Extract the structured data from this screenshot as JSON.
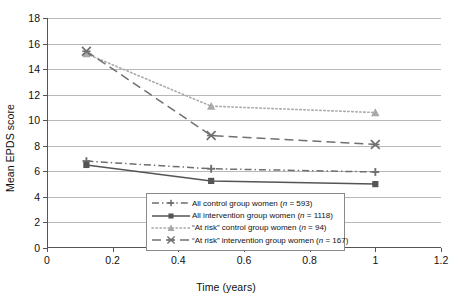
{
  "chart_data": {
    "type": "line",
    "title": "",
    "xlabel": "Time (years)",
    "ylabel": "Mean EPDS score",
    "xlim": [
      0,
      1.2
    ],
    "ylim": [
      0,
      18
    ],
    "x_ticks": [
      "0",
      "0.2",
      "0.4",
      "0.6",
      "0.8",
      "1",
      "1.2"
    ],
    "x_tick_values": [
      0,
      0.2,
      0.4,
      0.6,
      0.8,
      1,
      1.2
    ],
    "y_ticks": [
      "0",
      "2",
      "4",
      "6",
      "8",
      "10",
      "12",
      "14",
      "16",
      "18"
    ],
    "y_tick_values": [
      0,
      2,
      4,
      6,
      8,
      10,
      12,
      14,
      16,
      18
    ],
    "grid": "horizontal",
    "legend_position": "inside-bottom-center",
    "x": [
      0.12,
      0.5,
      1.0
    ],
    "series": [
      {
        "name": "All control group women (n = 593)",
        "label_text": "All control group women (",
        "label_n": "n",
        "label_tail": " = 593)",
        "values": [
          6.8,
          6.2,
          5.95
        ],
        "marker": "plus",
        "linestyle": "dash-dot",
        "color": "#6e6e6e"
      },
      {
        "name": "All intervention group women (n = 1118)",
        "label_text": "All intervention group women (",
        "label_n": "n",
        "label_tail": " = 1118)",
        "values": [
          6.5,
          5.25,
          5.0
        ],
        "marker": "square",
        "linestyle": "solid",
        "color": "#555555"
      },
      {
        "name": "\"At risk\" control group women (n = 94)",
        "label_text": "“At risk” control group women (",
        "label_n": "n",
        "label_tail": " = 94)",
        "values": [
          15.2,
          11.1,
          10.6
        ],
        "marker": "triangle",
        "linestyle": "dotted",
        "color": "#a8a8a8"
      },
      {
        "name": "\"At risk\" intervention group women (n = 167)",
        "label_text": "“At risk” intervention group women (",
        "label_n": "n",
        "label_tail": " = 167)",
        "values": [
          15.4,
          8.8,
          8.1
        ],
        "marker": "cross-star",
        "linestyle": "dashed",
        "color": "#707070"
      }
    ]
  },
  "colors": {
    "grid": "#b8b8b8",
    "axis": "#555555",
    "text": "#111111",
    "background": "#ffffff",
    "legend_border": "#8a8a8a"
  }
}
